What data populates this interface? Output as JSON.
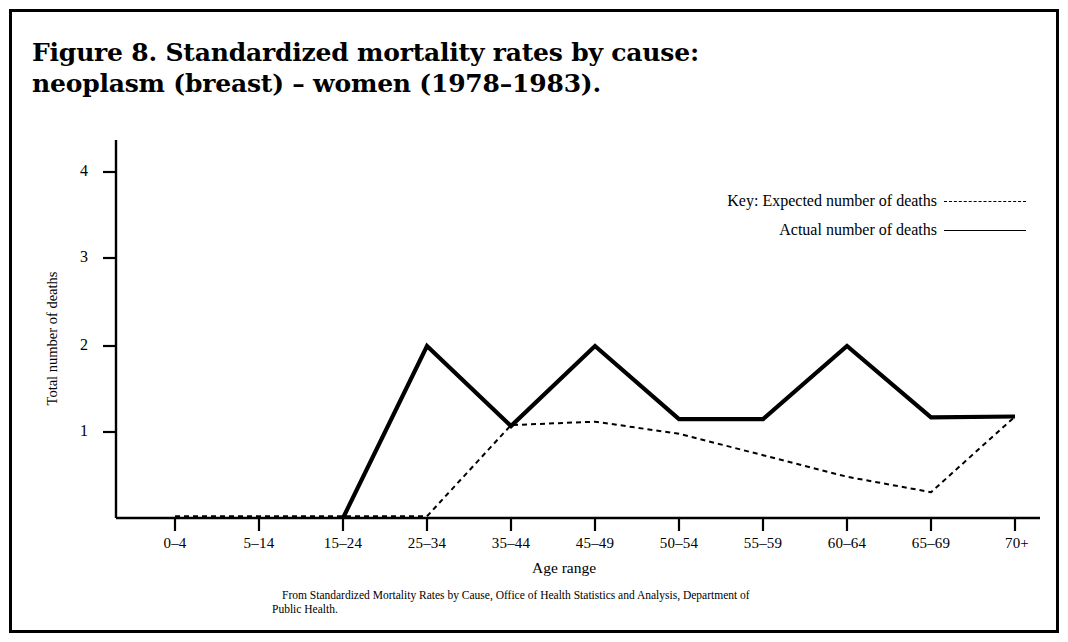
{
  "figure": {
    "title_line1": "Figure 8. Standardized mortality rates by cause:",
    "title_line2": "neoplasm (breast) – women (1978–1983).",
    "source_line1": "From Standardized Mortality Rates by Cause, Office of Health Statistics and Analysis, Department of",
    "source_line2": "Public Health."
  },
  "legend": {
    "key_prefix": "Key:",
    "expected_label": "Key: Expected number of deaths",
    "actual_label": "Actual number of deaths",
    "expected_style": "dashed",
    "actual_style": "solid"
  },
  "axes": {
    "ylabel": "Total number of deaths",
    "xlabel": "Age range",
    "yticks": [
      "1",
      "2",
      "3",
      "4"
    ],
    "ytick_values": [
      1,
      2,
      3,
      4
    ]
  },
  "chart_data": {
    "type": "line",
    "title": "Figure 8. Standardized mortality rates by cause: neoplasm (breast) – women (1978–1983).",
    "xlabel": "Age range",
    "ylabel": "Total number of deaths",
    "categories": [
      "0–4",
      "5–14",
      "15–24",
      "25–34",
      "35–44",
      "45–49",
      "50–54",
      "55–59",
      "60–64",
      "65–69",
      "70+"
    ],
    "series": [
      {
        "name": "Actual number of deaths",
        "style": "solid",
        "color": "#000000",
        "start_category": "15–24",
        "values": [
          null,
          null,
          0.0,
          2.0,
          1.07,
          2.0,
          1.15,
          1.15,
          2.0,
          1.17,
          1.18
        ]
      },
      {
        "name": "Expected number of deaths",
        "style": "dashed",
        "color": "#000000",
        "values": [
          0.02,
          0.02,
          0.02,
          0.02,
          1.08,
          1.12,
          0.98,
          0.73,
          0.48,
          0.3,
          1.18
        ]
      }
    ],
    "ylim": [
      0,
      4.4
    ],
    "grid": false,
    "legend_position": "upper right"
  }
}
